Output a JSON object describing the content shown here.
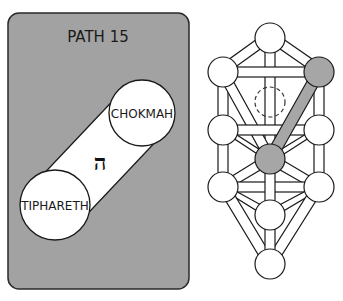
{
  "card": {
    "title": "PATH 15",
    "background": "#a2a2a2",
    "from_sephirah": "CHOKMAH",
    "to_sephirah": "TIPHARETH",
    "hebrew_letter": "ה",
    "hebrew_letter_name": "He"
  },
  "tree": {
    "highlight_color": "#a6a6a6",
    "highlighted_path": [
      "chokmah",
      "tiphareth"
    ],
    "sephiroth": [
      {
        "id": "kether",
        "x": 270,
        "y": 38,
        "highlighted": false
      },
      {
        "id": "chokmah",
        "x": 319,
        "y": 72,
        "highlighted": true
      },
      {
        "id": "binah",
        "x": 223,
        "y": 72,
        "highlighted": false
      },
      {
        "id": "daath",
        "x": 270,
        "y": 102,
        "hidden": true
      },
      {
        "id": "chesed",
        "x": 319,
        "y": 130,
        "highlighted": false
      },
      {
        "id": "geburah",
        "x": 223,
        "y": 130,
        "highlighted": false
      },
      {
        "id": "tiphareth",
        "x": 270,
        "y": 159,
        "highlighted": true
      },
      {
        "id": "netzach",
        "x": 319,
        "y": 187,
        "highlighted": false
      },
      {
        "id": "hod",
        "x": 223,
        "y": 187,
        "highlighted": false
      },
      {
        "id": "yesod",
        "x": 270,
        "y": 215,
        "highlighted": false
      },
      {
        "id": "malkuth",
        "x": 270,
        "y": 264,
        "highlighted": false
      }
    ]
  }
}
